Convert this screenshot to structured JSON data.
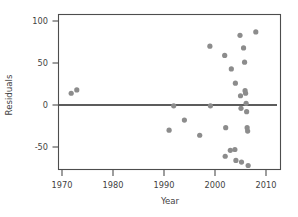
{
  "chart_data": {
    "type": "scatter",
    "title": "",
    "xlabel": "Year",
    "ylabel": "Residuals",
    "xlim": [
      1967.5,
      2011.0
    ],
    "ylim": [
      -80,
      107
    ],
    "grid": false,
    "legend": null,
    "xticks": [
      1970,
      1980,
      1990,
      2000,
      2010
    ],
    "xticklabels": [
      "1970",
      "1980",
      "1990",
      "2000",
      "2010"
    ],
    "yticks": [
      -50,
      0,
      50,
      100
    ],
    "yticklabels": [
      "-50",
      "0",
      "50",
      "100"
    ],
    "annotations": [
      {
        "type": "hline",
        "y": 0,
        "label": "zero reference line"
      }
    ],
    "series": [
      {
        "name": "Residuals",
        "marker": "circle",
        "color": "#8c8c8c",
        "points": [
          {
            "x": 1971.8,
            "y": 14
          },
          {
            "x": 1972.9,
            "y": 18
          },
          {
            "x": 1991.0,
            "y": -30
          },
          {
            "x": 1991.9,
            "y": -1
          },
          {
            "x": 1994.0,
            "y": -18
          },
          {
            "x": 1997.0,
            "y": -36
          },
          {
            "x": 1999.0,
            "y": 70
          },
          {
            "x": 1999.1,
            "y": -1
          },
          {
            "x": 2001.9,
            "y": 59
          },
          {
            "x": 2002.0,
            "y": -61
          },
          {
            "x": 2002.1,
            "y": -27
          },
          {
            "x": 2003.0,
            "y": -54
          },
          {
            "x": 2003.2,
            "y": 43
          },
          {
            "x": 2003.9,
            "y": -53
          },
          {
            "x": 2004.0,
            "y": 26
          },
          {
            "x": 2004.1,
            "y": -66
          },
          {
            "x": 2004.9,
            "y": 83
          },
          {
            "x": 2005.0,
            "y": 11
          },
          {
            "x": 2005.1,
            "y": -4
          },
          {
            "x": 2005.2,
            "y": -68
          },
          {
            "x": 2005.6,
            "y": 68
          },
          {
            "x": 2005.8,
            "y": 51
          },
          {
            "x": 2005.9,
            "y": 17
          },
          {
            "x": 2006.0,
            "y": 14
          },
          {
            "x": 2006.1,
            "y": 2
          },
          {
            "x": 2006.2,
            "y": -8
          },
          {
            "x": 2006.3,
            "y": -27
          },
          {
            "x": 2006.4,
            "y": -31
          },
          {
            "x": 2006.5,
            "y": -72
          },
          {
            "x": 2008.0,
            "y": 87
          }
        ]
      }
    ]
  },
  "axes": {
    "x_title": "Year",
    "y_title": "Residuals"
  },
  "style": {
    "point_color": "#8c8c8c",
    "frame_color": "#4d4d4d",
    "refline_color": "#262626",
    "text_color": "#3f3f3f",
    "background": "#ffffff"
  }
}
